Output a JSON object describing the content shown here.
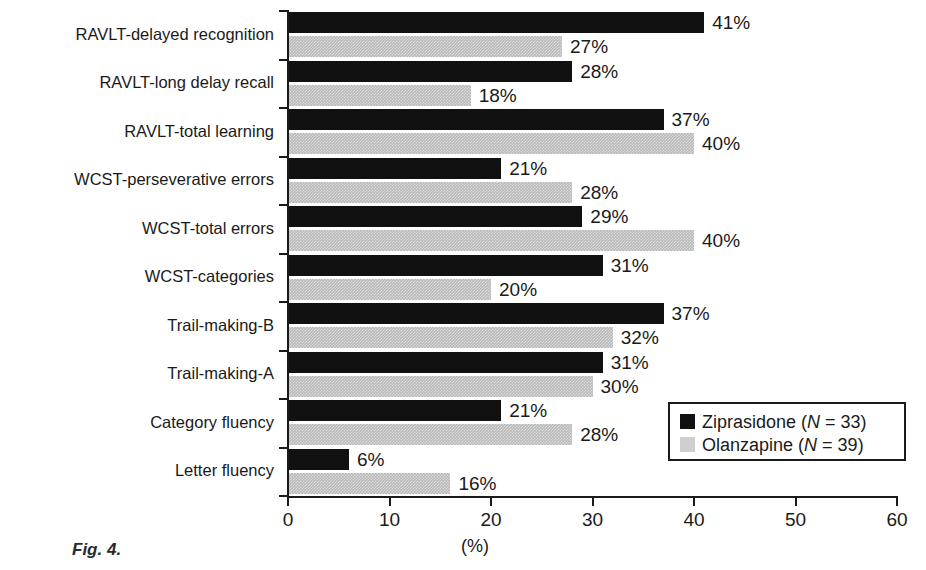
{
  "figure": {
    "caption": "Fig. 4."
  },
  "chart_data": {
    "type": "bar",
    "orientation": "horizontal",
    "title": "",
    "xlabel": "(%)",
    "ylabel": "",
    "xlim": [
      0,
      60
    ],
    "xticks": [
      0,
      10,
      20,
      30,
      40,
      50,
      60
    ],
    "xtick_labels": [
      "0",
      "10",
      "20",
      "30",
      "40",
      "50",
      "60"
    ],
    "grid": false,
    "legend_position": "lower-right",
    "categories": [
      "RAVLT-delayed recognition",
      "RAVLT-long delay recall",
      "RAVLT-total learning",
      "WCST-perseverative errors",
      "WCST-total errors",
      "WCST-categories",
      "Trail-making-B",
      "Trail-making-A",
      "Category fluency",
      "Letter fluency"
    ],
    "series": [
      {
        "name": "Ziprasidone (N = 33)",
        "legend_label_plain": "Ziprasidone",
        "legend_n": "(N = 33)",
        "color": "#111111",
        "values": [
          41,
          28,
          37,
          21,
          29,
          31,
          37,
          31,
          21,
          6
        ],
        "value_labels": [
          "41%",
          "28%",
          "37%",
          "21%",
          "29%",
          "31%",
          "37%",
          "31%",
          "21%",
          "6%"
        ]
      },
      {
        "name": "Olanzapine (N = 39)",
        "legend_label_plain": "Olanzapine",
        "legend_n": "(N = 39)",
        "color": "#b9b9b9",
        "values": [
          27,
          18,
          40,
          28,
          40,
          20,
          32,
          30,
          28,
          16
        ],
        "value_labels": [
          "27%",
          "18%",
          "40%",
          "28%",
          "40%",
          "20%",
          "32%",
          "30%",
          "28%",
          "16%"
        ]
      }
    ]
  }
}
